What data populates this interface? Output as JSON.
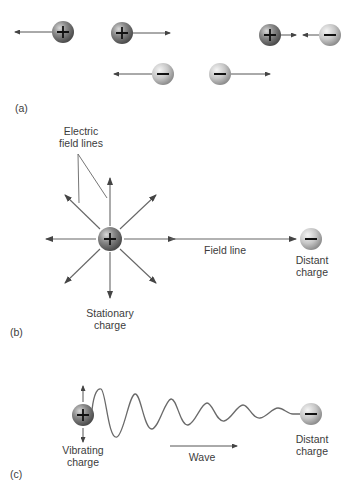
{
  "figure": {
    "panel_a": {
      "label": "(a)",
      "pairs": [
        {
          "charge": "+",
          "direction": "left"
        },
        {
          "charge": "+",
          "direction": "right"
        },
        {
          "charge": "-",
          "direction": "left"
        },
        {
          "charge": "-",
          "direction": "right"
        },
        {
          "charges": [
            "+",
            "-"
          ],
          "direction": "attract"
        }
      ]
    },
    "panel_b": {
      "label": "(b)",
      "electric_field_lines_label": "Electric\nfield lines",
      "field_line_label": "Field line",
      "stationary_charge_label": "Stationary\ncharge",
      "distant_charge_label": "Distant\ncharge",
      "center_charge": "+",
      "distant_charge": "-"
    },
    "panel_c": {
      "label": "(c)",
      "vibrating_charge_label": "Vibrating\ncharge",
      "wave_label": "Wave",
      "distant_charge_label": "Distant\ncharge",
      "source_charge": "+",
      "distant_charge": "-"
    },
    "colors": {
      "positive_charge": "#6e6e6e",
      "negative_charge": "#c4c4c4",
      "line": "#555555"
    }
  }
}
